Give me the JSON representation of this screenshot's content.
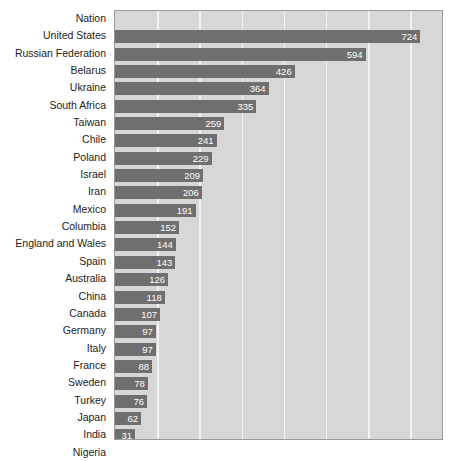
{
  "chart_data": {
    "type": "bar",
    "orientation": "horizontal",
    "title": "",
    "xlabel": "",
    "ylabel": "",
    "header_label": "Nation",
    "grid": true,
    "legend": false,
    "xlim": [
      0,
      780
    ],
    "gridline_step": 100,
    "gridline_values": [
      100,
      200,
      300,
      400,
      500,
      600,
      700
    ],
    "categories": [
      "United States",
      "Russian Federation",
      "Belarus",
      "Ukraine",
      "South Africa",
      "Taiwan",
      "Chile",
      "Poland",
      "Israel",
      "Iran",
      "Mexico",
      "Columbia",
      "England and Wales",
      "Spain",
      "Australia",
      "China",
      "Canada",
      "Germany",
      "Italy",
      "France",
      "Sweden",
      "Turkey",
      "Japan",
      "India",
      "Nigeria"
    ],
    "values": [
      724,
      594,
      426,
      364,
      335,
      259,
      241,
      229,
      209,
      206,
      191,
      152,
      144,
      143,
      126,
      118,
      107,
      97,
      97,
      88,
      78,
      76,
      62,
      31,
      30
    ],
    "rows": [
      {
        "label": "Nation",
        "value": null,
        "header": true
      },
      {
        "label": "United States",
        "value": 724
      },
      {
        "label": "Russian Federation",
        "value": 594
      },
      {
        "label": "Belarus",
        "value": 426
      },
      {
        "label": "Ukraine",
        "value": 364
      },
      {
        "label": "South Africa",
        "value": 335
      },
      {
        "label": "Taiwan",
        "value": 259
      },
      {
        "label": "Chile",
        "value": 241
      },
      {
        "label": "Poland",
        "value": 229
      },
      {
        "label": "Israel",
        "value": 209
      },
      {
        "label": "Iran",
        "value": 206
      },
      {
        "label": "Mexico",
        "value": 191
      },
      {
        "label": "Columbia",
        "value": 152
      },
      {
        "label": "England and Wales",
        "value": 144
      },
      {
        "label": "Spain",
        "value": 143
      },
      {
        "label": "Australia",
        "value": 126
      },
      {
        "label": "China",
        "value": 118
      },
      {
        "label": "Canada",
        "value": 107
      },
      {
        "label": "Germany",
        "value": 97
      },
      {
        "label": "Italy",
        "value": 97
      },
      {
        "label": "France",
        "value": 88
      },
      {
        "label": "Sweden",
        "value": 78
      },
      {
        "label": "Turkey",
        "value": 76
      },
      {
        "label": "Japan",
        "value": 62
      },
      {
        "label": "India",
        "value": 31
      },
      {
        "label": "Nigeria",
        "value": 30
      }
    ]
  },
  "colors": {
    "bar": "#6f6f6f",
    "plot_background": "#d7d7d7",
    "gridline": "#f2f2f2",
    "value_text": "#ffffff",
    "label_text": "#1c1c1c",
    "plot_border": "#9a9a9a",
    "page_background": "#ffffff"
  }
}
